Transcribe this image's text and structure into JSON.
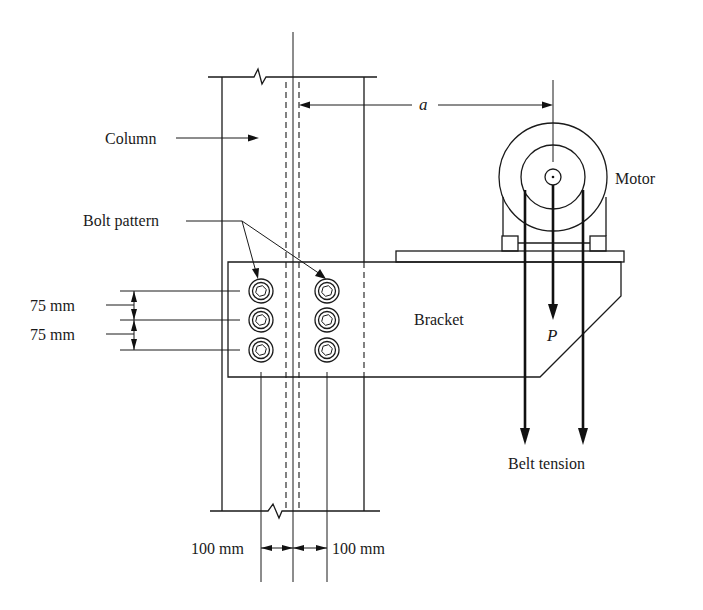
{
  "figure": {
    "labels": {
      "column": "Column",
      "bolt_pattern": "Bolt pattern",
      "motor": "Motor",
      "bracket": "Bracket",
      "load": "P",
      "eccentricity": "a",
      "belt_tension": "Belt tension"
    },
    "dimensions": {
      "vertical_spacing_1": "75 mm",
      "vertical_spacing_2": "75 mm",
      "horizontal_left": "100 mm",
      "horizontal_right": "100 mm"
    },
    "bolt_pattern": {
      "columns": 2,
      "rows": 3,
      "count": 6,
      "vertical_pitch_mm": 75,
      "horizontal_offset_from_centerline_mm": 100
    }
  }
}
